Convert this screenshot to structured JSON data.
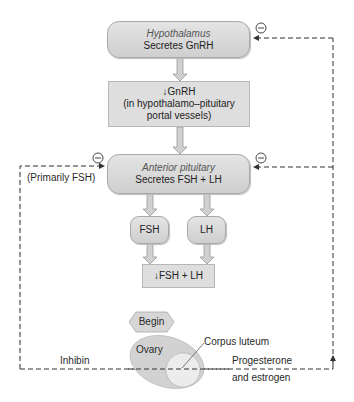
{
  "diagram": {
    "hypothalamus": {
      "title": "Hypothalamus",
      "subtitle": "Secretes GnRH"
    },
    "gnrh_box": {
      "line1": "↓GnRH",
      "line2": "(in hypothalamo–pituitary",
      "line3": "portal vessels)"
    },
    "anterior_pituitary": {
      "title": "Anterior pituitary",
      "subtitle": "Secretes FSH + LH"
    },
    "fsh": "FSH",
    "lh": "LH",
    "fsh_lh_box": "↓FSH + LH",
    "begin": "Begin",
    "ovary": "Ovary",
    "corpus_luteum": "Corpus luteum",
    "left_feedback_label": "(Primarily FSH)",
    "inhibin": "Inhibin",
    "progesterone_line1": "Progesterone",
    "progesterone_line2": "and estrogen",
    "inhibit_symbol": "−"
  },
  "colors": {
    "box_fill": "#d8d8d8",
    "border": "#a8a8a8",
    "arrow_fill": "#cfcfcf",
    "dashed_line": "#333333",
    "ovary_fill": "#d4d4d4",
    "corpus_luteum_fill": "#ececec"
  }
}
